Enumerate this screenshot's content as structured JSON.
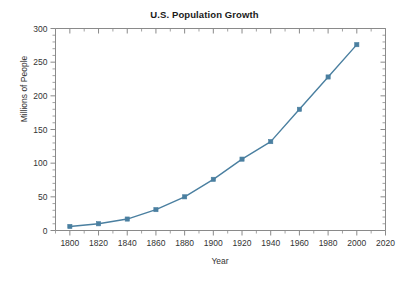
{
  "chart_data": {
    "type": "line",
    "title": "U.S. Population Growth",
    "xlabel": "Year",
    "ylabel": "Millions of People",
    "x": [
      1800,
      1820,
      1840,
      1860,
      1880,
      1900,
      1920,
      1940,
      1960,
      1980,
      2000
    ],
    "values": [
      6,
      10,
      17,
      31,
      50,
      76,
      106,
      132,
      180,
      228,
      276
    ],
    "xlim": [
      1790,
      2020
    ],
    "ylim": [
      0,
      300
    ],
    "xticks": [
      1800,
      1820,
      1840,
      1860,
      1880,
      1900,
      1920,
      1940,
      1960,
      1980,
      2000,
      2020
    ],
    "xtick_labels": [
      "1800",
      "1820",
      "1840",
      "1860",
      "1880",
      "1900",
      "1920",
      "1940",
      "1960",
      "1980",
      "2000",
      "2020"
    ],
    "yticks": [
      0,
      50,
      100,
      150,
      200,
      250,
      300
    ],
    "ytick_labels": [
      "0",
      "50",
      "100",
      "150",
      "200",
      "250",
      "300"
    ],
    "y_minor_interval": 10,
    "x_minor_interval": 10,
    "grid": false,
    "legend": false,
    "series_color": "#4a7fa0",
    "marker": "square",
    "axis_color": "#8a8a8a"
  },
  "figure": {
    "background": "#ffffff",
    "title_color": "#1a1a1a",
    "label_color": "#333333"
  }
}
